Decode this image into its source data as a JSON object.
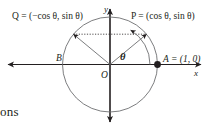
{
  "figure": {
    "axes": {
      "x_label": "x",
      "y_label": "y",
      "origin_label": "O"
    },
    "points": [
      {
        "id": "P",
        "label": "P = (cos θ, sin θ)",
        "x": 0.77,
        "y": 0.64,
        "filled": false
      },
      {
        "id": "Q",
        "label": "Q = (−cos θ, sin θ)",
        "x": -0.77,
        "y": 0.64,
        "filled": false
      },
      {
        "id": "A",
        "label": "A = (1, 0)",
        "x": 1.0,
        "y": 0.0,
        "filled": true
      },
      {
        "id": "B",
        "label": "B",
        "x": -1.0,
        "y": 0.0,
        "filled": false
      }
    ],
    "angle": {
      "symbol": "θ",
      "description": "angle from positive x-axis to radius OP"
    },
    "colors": {
      "ink": "#231f20",
      "background": "#ffffff"
    },
    "circle": {
      "radius_units": 1,
      "center_label": "O"
    }
  },
  "page": {
    "caption_fragment": "ons"
  }
}
